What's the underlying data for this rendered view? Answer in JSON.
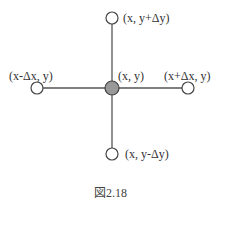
{
  "diagram": {
    "nodes": {
      "center": {
        "label": "(x, y)",
        "filled": true
      },
      "top": {
        "label": "(x, y+Δy)"
      },
      "left": {
        "label": "(x-Δx, y)"
      },
      "right": {
        "label": "(x+Δx, y)"
      },
      "bottom": {
        "label": "(x, y-Δy)"
      }
    },
    "caption": "図2.18",
    "colors": {
      "line": "#555555",
      "node_stroke": "#444444",
      "center_fill": "#999999"
    }
  }
}
